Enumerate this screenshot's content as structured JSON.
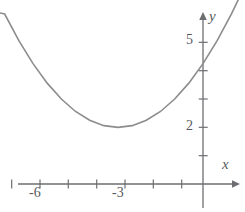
{
  "figure": {
    "kind": "cartesian-graph",
    "background": "#ffffff",
    "curve_color": "#8c8c8c",
    "axis_color": "#6d6e71",
    "text_color": "#58595b"
  },
  "axes": {
    "x_axis": {
      "label": "x",
      "tick_labels": [
        "-6",
        "-3"
      ],
      "tick_values": [
        -7,
        -6,
        -5,
        -4,
        -3,
        -2,
        -1
      ],
      "labeled_ticks": [
        -6,
        -3
      ],
      "arrow": "right"
    },
    "y_axis": {
      "label": "y",
      "tick_labels": [
        "5",
        "2"
      ],
      "tick_values": [
        1,
        2,
        3,
        4,
        5
      ],
      "labeled_ticks": [
        5,
        2
      ],
      "arrow": "up"
    }
  },
  "chart_data": {
    "type": "line",
    "title": "",
    "xlabel": "x",
    "ylabel": "y",
    "xlim": [
      -7.4,
      1.5
    ],
    "ylim": [
      -0.4,
      6.2
    ],
    "grid": false,
    "legend": null,
    "annotations": [],
    "series": [
      {
        "name": "parabola",
        "description": "upward parabola with vertex at (-3, 2)",
        "vertex": [
          -3,
          2
        ],
        "y_intercept": 4.25,
        "equation": "y = 0.25*(x + 3)^2 + 2",
        "color": "#8c8c8c",
        "x": [
          -7.4,
          -7.0,
          -6.5,
          -6.0,
          -5.5,
          -5.0,
          -4.5,
          -4.0,
          -3.5,
          -3.0,
          -2.5,
          -2.0,
          -1.5,
          -1.0,
          -0.5,
          0.0,
          0.5,
          1.0,
          1.3
        ],
        "y": [
          6.09,
          6.0,
          5.06,
          4.25,
          3.56,
          3.0,
          2.56,
          2.25,
          2.06,
          2.0,
          2.06,
          2.25,
          2.56,
          3.0,
          3.56,
          4.25,
          5.06,
          6.0,
          6.62
        ]
      }
    ]
  }
}
